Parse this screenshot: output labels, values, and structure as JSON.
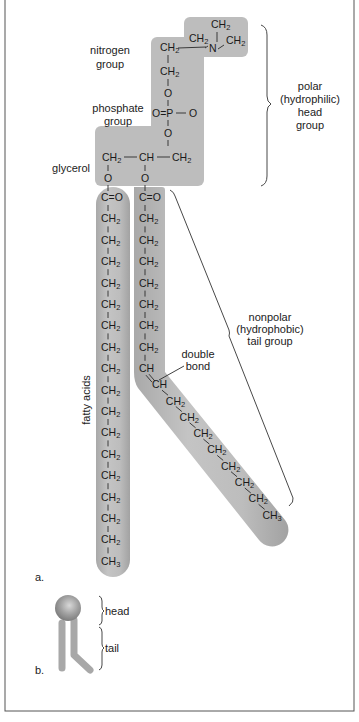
{
  "figure": {
    "panel_a_label": "a.",
    "panel_b_label": "b.",
    "colors": {
      "background": "#ffffff",
      "frame": "#555555",
      "molecule_fill": "#b9b9b9",
      "text": "#222222"
    }
  },
  "labels": {
    "nitrogen_group": [
      "nitrogen",
      "group"
    ],
    "phosphate_group": [
      "phosphate",
      "group"
    ],
    "glycerol": "glycerol",
    "fatty_acids": "fatty acids",
    "double_bond": [
      "double",
      "bond"
    ],
    "polar_head": [
      "polar",
      "(hydrophilic)",
      "head",
      "group"
    ],
    "nonpolar_tail": [
      "nonpolar",
      "(hydrophobic)",
      "tail group"
    ],
    "schematic_head": "head",
    "schematic_tail": "tail"
  },
  "head_group": {
    "nitrogen": {
      "center": "N",
      "methyls": [
        "CH2",
        "CH2",
        "CH2"
      ],
      "link": "CH2"
    },
    "linker": [
      "CH2",
      "O"
    ],
    "phosphate": {
      "left": "O=",
      "center": "P",
      "right": "O",
      "below": "O"
    },
    "glycerol": [
      "CH2",
      "CH",
      "CH2"
    ],
    "ester_oxygens": [
      "O",
      "O"
    ]
  },
  "fatty_acid_1": {
    "carbonyl": "C=O",
    "units": [
      "CH2",
      "CH2",
      "CH2",
      "CH2",
      "CH2",
      "CH2",
      "CH2",
      "CH2",
      "CH2",
      "CH2",
      "CH2",
      "CH2",
      "CH2",
      "CH2",
      "CH2",
      "CH2"
    ],
    "terminal": "CH3"
  },
  "fatty_acid_2": {
    "carbonyl": "C=O",
    "units_before_double_bond": [
      "CH2",
      "CH2",
      "CH2",
      "CH2",
      "CH2",
      "CH2",
      "CH2"
    ],
    "double_bond": [
      "CH",
      "CH"
    ],
    "units_after_double_bond": [
      "CH2",
      "CH2",
      "CH2",
      "CH2",
      "CH2",
      "CH2",
      "CH2"
    ],
    "terminal": "CH3"
  }
}
